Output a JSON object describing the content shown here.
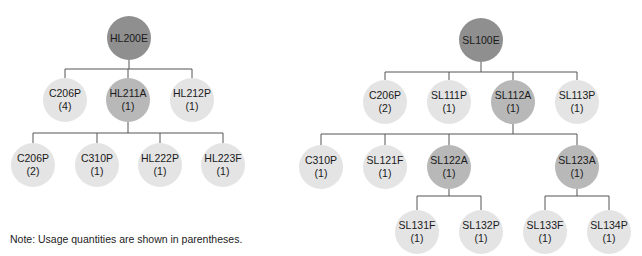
{
  "trees": [
    {
      "name": "HL200E tree",
      "nodes": [
        {
          "id": "HL200E",
          "label": "HL200E",
          "qty": "",
          "type": "root",
          "x": 129,
          "y": 38
        },
        {
          "id": "L_C206P",
          "label": "C206P",
          "qty": "(4)",
          "type": "part",
          "x": 65,
          "y": 100
        },
        {
          "id": "HL211A",
          "label": "HL211A",
          "qty": "(1)",
          "type": "assy",
          "x": 128,
          "y": 100
        },
        {
          "id": "HL212P",
          "label": "HL212P",
          "qty": "(1)",
          "type": "part",
          "x": 192,
          "y": 100
        },
        {
          "id": "L_C206P_2",
          "label": "C206P",
          "qty": "(2)",
          "type": "part",
          "x": 33,
          "y": 165
        },
        {
          "id": "L_C310P",
          "label": "C310P",
          "qty": "(1)",
          "type": "part",
          "x": 97,
          "y": 165
        },
        {
          "id": "HL222P",
          "label": "HL222P",
          "qty": "(1)",
          "type": "part",
          "x": 160,
          "y": 165
        },
        {
          "id": "HL223F",
          "label": "HL223F",
          "qty": "(1)",
          "type": "part",
          "x": 223,
          "y": 165
        }
      ],
      "edges": [
        {
          "parent": "HL200E",
          "bar_y": 69,
          "children": [
            "L_C206P",
            "HL211A",
            "HL212P"
          ]
        },
        {
          "parent": "HL211A",
          "bar_y": 133,
          "children": [
            "L_C206P_2",
            "L_C310P",
            "HL222P",
            "HL223F"
          ]
        }
      ]
    },
    {
      "name": "SL100E tree",
      "nodes": [
        {
          "id": "SL100E",
          "label": "SL100E",
          "qty": "",
          "type": "root",
          "x": 481,
          "y": 40
        },
        {
          "id": "R_C206P",
          "label": "C206P",
          "qty": "(2)",
          "type": "part",
          "x": 385,
          "y": 102
        },
        {
          "id": "SL111P",
          "label": "SL111P",
          "qty": "(1)",
          "type": "part",
          "x": 449,
          "y": 102
        },
        {
          "id": "SL112A",
          "label": "SL112A",
          "qty": "(1)",
          "type": "assy",
          "x": 513,
          "y": 102
        },
        {
          "id": "SL113P",
          "label": "SL113P",
          "qty": "(1)",
          "type": "part",
          "x": 577,
          "y": 102
        },
        {
          "id": "R_C310P",
          "label": "C310P",
          "qty": "(1)",
          "type": "part",
          "x": 321,
          "y": 167
        },
        {
          "id": "SL121F",
          "label": "SL121F",
          "qty": "(1)",
          "type": "part",
          "x": 385,
          "y": 167
        },
        {
          "id": "SL122A",
          "label": "SL122A",
          "qty": "(1)",
          "type": "assy",
          "x": 449,
          "y": 167
        },
        {
          "id": "SL123A",
          "label": "SL123A",
          "qty": "(1)",
          "type": "assy",
          "x": 577,
          "y": 167
        },
        {
          "id": "SL131F",
          "label": "SL131F",
          "qty": "(1)",
          "type": "part",
          "x": 417,
          "y": 232
        },
        {
          "id": "SL132P",
          "label": "SL132P",
          "qty": "(1)",
          "type": "part",
          "x": 481,
          "y": 232
        },
        {
          "id": "SL133F",
          "label": "SL133F",
          "qty": "(1)",
          "type": "part",
          "x": 545,
          "y": 232
        },
        {
          "id": "SL134P",
          "label": "SL134P",
          "qty": "(1)",
          "type": "part",
          "x": 609,
          "y": 232
        }
      ],
      "edges": [
        {
          "parent": "SL100E",
          "bar_y": 72,
          "children": [
            "R_C206P",
            "SL111P",
            "SL112A",
            "SL113P"
          ]
        },
        {
          "parent": "SL112A",
          "bar_y": 134,
          "children": [
            "R_C310P",
            "SL121F",
            "SL122A",
            "SL123A"
          ]
        },
        {
          "parent": "SL122A",
          "bar_y": 196,
          "children": [
            "SL131F",
            "SL132P"
          ]
        },
        {
          "parent": "SL123A",
          "bar_y": 196,
          "children": [
            "SL133F",
            "SL134P"
          ]
        }
      ]
    }
  ],
  "note": "Note: Usage quantities are shown in parentheses.",
  "colors": {
    "root": "#8f8f8f",
    "assy": "#b8b8b8",
    "part": "#e4e4e4",
    "line": "#555555"
  }
}
